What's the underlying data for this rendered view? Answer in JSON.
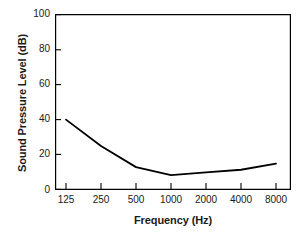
{
  "chart_data": {
    "type": "line",
    "title": "",
    "xlabel": "Frequency (Hz)",
    "ylabel": "Sound Pressure Level (dB)",
    "categories": [
      "125",
      "250",
      "500",
      "1000",
      "2000",
      "4000",
      "8000"
    ],
    "x": [
      125,
      250,
      500,
      1000,
      2000,
      4000,
      8000
    ],
    "values": [
      40,
      25,
      13,
      8.5,
      10,
      11.5,
      15
    ],
    "series": [
      {
        "name": "Sound Pressure Level",
        "values": [
          40,
          25,
          13,
          8.5,
          10,
          11.5,
          15
        ]
      }
    ],
    "xtick_labels": [
      "125",
      "250",
      "500",
      "1000",
      "2000",
      "4000",
      "8000"
    ],
    "ytick_labels": [
      "0",
      "20",
      "40",
      "60",
      "80",
      "100"
    ],
    "yticks": [
      0,
      20,
      40,
      60,
      80,
      100
    ],
    "ylim": [
      0,
      100
    ],
    "xscale": "log-octave",
    "grid": false,
    "legend": false,
    "line_color": "#000000",
    "axis_color": "#000000",
    "background_color": "#ffffff"
  }
}
